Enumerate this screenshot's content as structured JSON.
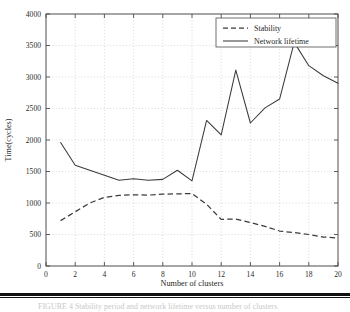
{
  "figure": {
    "caption_fragment": "FIGURE 4 Stability period and network lifetime versus number of clusters."
  },
  "chart_data": {
    "type": "line",
    "title": "",
    "xlabel": "Number of clusters",
    "ylabel": "Time(cycles)",
    "xlim": [
      0,
      20
    ],
    "ylim": [
      0,
      4000
    ],
    "xticks": [
      0,
      2,
      4,
      6,
      8,
      10,
      12,
      14,
      16,
      18,
      20
    ],
    "xtick_labels": [
      "0",
      "2",
      "4",
      "6",
      "8",
      "10",
      "12",
      "14",
      "16",
      "18",
      "20"
    ],
    "yticks": [
      0,
      500,
      1000,
      1500,
      2000,
      2500,
      3000,
      3500,
      4000
    ],
    "ytick_labels": [
      "0",
      "500",
      "1000",
      "1500",
      "2000",
      "2500",
      "3000",
      "3500",
      "4000"
    ],
    "grid": true,
    "grid_style": "dotted",
    "legend_position": "top-right",
    "x": [
      1,
      2,
      3,
      4,
      5,
      6,
      7,
      8,
      9,
      10,
      11,
      12,
      13,
      14,
      15,
      16,
      17,
      18,
      19,
      20
    ],
    "series": [
      {
        "name": "Stability",
        "style": "dashed",
        "color": "#3b3b3b",
        "values": [
          720,
          860,
          1000,
          1090,
          1120,
          1130,
          1125,
          1140,
          1145,
          1150,
          980,
          740,
          745,
          690,
          630,
          555,
          530,
          500,
          460,
          445
        ]
      },
      {
        "name": "Network lifetime",
        "style": "solid",
        "color": "#3b3b3b",
        "values": [
          1960,
          1600,
          1520,
          1440,
          1360,
          1385,
          1360,
          1375,
          1520,
          1350,
          2310,
          2080,
          3110,
          2270,
          2510,
          2650,
          3550,
          3180,
          3020,
          2900
        ]
      }
    ]
  }
}
